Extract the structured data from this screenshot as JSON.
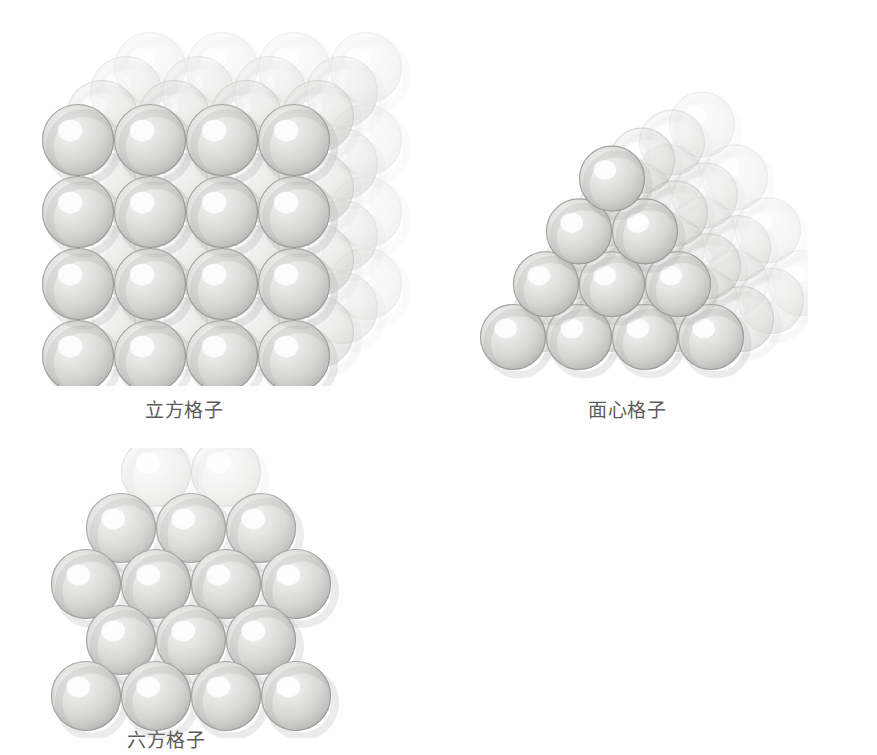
{
  "page": {
    "background_color": "#ffffff",
    "width": 877,
    "height": 755
  },
  "figures": [
    {
      "id": "cubic",
      "label": "立方格子",
      "label_color": "#5b5b5b",
      "description": "simple cubic close packing of spheres, 4 by 4 front face with 3 receding layers",
      "sphere": {
        "diameter": 72,
        "front_fill": "#f2f2f0",
        "edge_color": "#9a9a98",
        "highlight_color": "#ffffff",
        "shadow_color": "#b4b4b2"
      },
      "grid": {
        "cols": 4,
        "rows": 4,
        "depth": 4
      },
      "depth_offset": {
        "x": 24,
        "y": -24
      }
    },
    {
      "id": "face_centered",
      "label": "面心格子",
      "label_color": "#5b5b5b",
      "description": "face centered cubic close packing drawn as a stepped pyramid, rows of 4, 3, 2 and 1 spheres with receding layers",
      "sphere": {
        "diameter": 66,
        "front_fill": "#ececea",
        "edge_color": "#939391",
        "highlight_color": "#ffffff",
        "shadow_color": "#acacaa"
      },
      "grid": {
        "base_count": 4,
        "levels": 4,
        "depth": 4
      },
      "depth_offset": {
        "x": 30,
        "y": -18
      }
    },
    {
      "id": "hexagonal",
      "label": "六方格子",
      "label_color": "#5b5b5b",
      "description": "hexagonal close packing, alternating rows of 3 and 4 spheres offset by half a diameter",
      "sphere": {
        "diameter": 70,
        "front_fill": "#f2f2f0",
        "edge_color": "#9a9a98",
        "highlight_color": "#ffffff",
        "shadow_color": "#b4b4b2"
      },
      "grid": {
        "rows": [
          3,
          4,
          3,
          4
        ],
        "back_row": 2
      },
      "depth_offset": {
        "x": 0,
        "y": -46
      }
    }
  ]
}
